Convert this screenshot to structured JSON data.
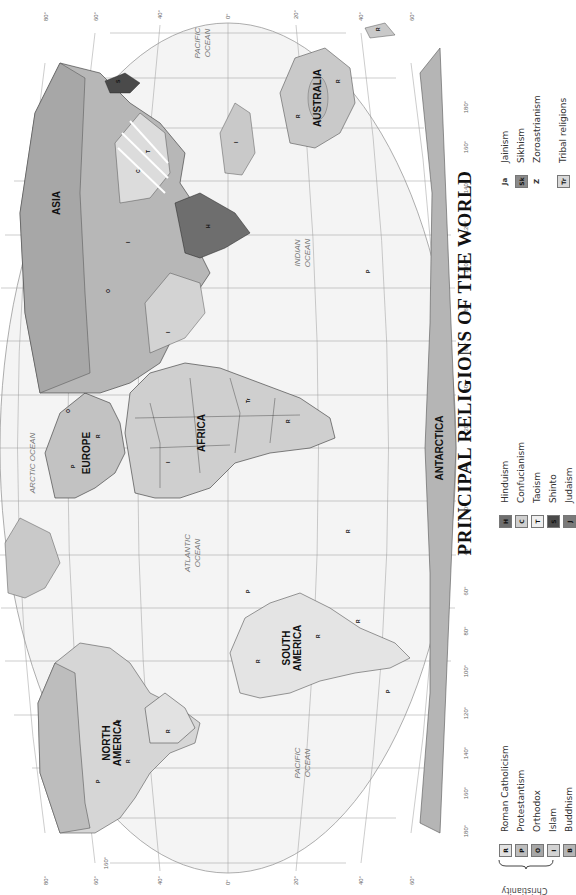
{
  "title": "PRINCIPAL RELIGIONS OF THE WORLD",
  "colors": {
    "ocean": "#f4f4f4",
    "land_default": "#c9c9c9",
    "roman_catholicism": "#e2e2e2",
    "protestantism": "#bdbdbd",
    "orthodox": "#a7a7a7",
    "islam": "#d3d3d3",
    "buddhism": "#b5b5b5",
    "hinduism": "#6e6e6e",
    "confucianism": "#cfcfcf",
    "taoism": "#efefef",
    "shinto": "#4a4a4a",
    "judaism": "#7a7a7a",
    "sikhism": "#8a8a8a",
    "tribal": "#d8d8d8",
    "graticule": "#9a9a9a",
    "border": "#222222"
  },
  "legend": {
    "christianity_label": "Christianity",
    "items": [
      {
        "symbol": "R",
        "label": "Roman Catholicism",
        "swatch": true
      },
      {
        "symbol": "P",
        "label": "Protestantism",
        "swatch": true
      },
      {
        "symbol": "O",
        "label": "Orthodox",
        "swatch": true
      },
      {
        "symbol": "I",
        "label": "Islam",
        "swatch": true
      },
      {
        "symbol": "B",
        "label": "Buddhism",
        "swatch": true
      },
      {
        "symbol": "H",
        "label": "Hinduism",
        "swatch": true
      },
      {
        "symbol": "C",
        "label": "Confucianism",
        "swatch": true
      },
      {
        "symbol": "T",
        "label": "Taoism",
        "swatch": true
      },
      {
        "symbol": "S",
        "label": "Shinto",
        "swatch": true
      },
      {
        "symbol": "J",
        "label": "Judaism",
        "swatch": true
      },
      {
        "symbol": "Ja",
        "label": "Jainism",
        "swatch": false
      },
      {
        "symbol": "Sk",
        "label": "Sikhism",
        "swatch": true
      },
      {
        "symbol": "Z",
        "label": "Zoroastrianism",
        "swatch": false
      },
      {
        "symbol": "Tr",
        "label": "Tribal religions",
        "swatch": true
      }
    ]
  },
  "map": {
    "continents": [
      "NORTH AMERICA",
      "SOUTH AMERICA",
      "EUROPE",
      "AFRICA",
      "ASIA",
      "AUSTRALIA",
      "ANTARCTICA"
    ],
    "oceans": [
      "PACIFIC OCEAN",
      "ATLANTIC OCEAN",
      "ARCTIC OCEAN",
      "INDIAN OCEAN",
      "PACIFIC OCEAN"
    ],
    "longitude_labels_bottom": [
      "180°",
      "160°",
      "140°",
      "120°",
      "100°",
      "80°",
      "60°",
      "40°",
      "20°",
      "0°",
      "20°",
      "40°",
      "60°",
      "80°",
      "100°",
      "120°",
      "140°",
      "160°",
      "180°"
    ],
    "longitude_labels_top": [
      "90°",
      "180°",
      "160°",
      "140°",
      "120°",
      "100°",
      "80°",
      "60°",
      "40°",
      "20°",
      "0°",
      "20°",
      "40°",
      "60°",
      "80°",
      "100°",
      "120°",
      "140°",
      "160°",
      "180°",
      "90°"
    ],
    "latitude_labels_left": [
      "80°",
      "60°",
      "40°",
      "20°",
      "0°",
      "20°",
      "40°",
      "60°",
      "80°"
    ],
    "latitude_labels_right": [
      "80°",
      "60°",
      "40°",
      "20°",
      "0°",
      "20°",
      "40°",
      "60°",
      "80°"
    ]
  }
}
